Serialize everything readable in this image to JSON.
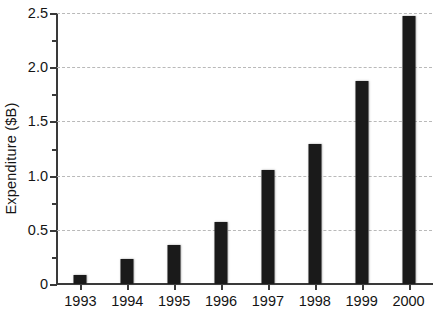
{
  "chart_data": {
    "type": "bar",
    "title": "",
    "xlabel": "",
    "ylabel": "Expenditure ($B)",
    "categories": [
      "1993",
      "1994",
      "1995",
      "1996",
      "1997",
      "1998",
      "1999",
      "2000"
    ],
    "values": [
      0.08,
      0.23,
      0.36,
      0.57,
      1.05,
      1.29,
      1.87,
      2.47
    ],
    "ylim": [
      0,
      2.5
    ],
    "y_major_ticks": [
      0,
      0.5,
      1.0,
      1.5,
      2.0,
      2.5
    ],
    "y_major_tick_labels": [
      "0",
      "0.5",
      "1.0",
      "1.5",
      "2.0",
      "2.5"
    ],
    "y_minor_ticks": [
      0.25,
      0.75,
      1.25,
      1.75,
      2.25
    ],
    "grid": "horizontal-dashed",
    "legend": "none",
    "bar_color": "#1a1a1a",
    "grid_color": "#b9b9b9",
    "axis_color": "#3a3a3a"
  }
}
